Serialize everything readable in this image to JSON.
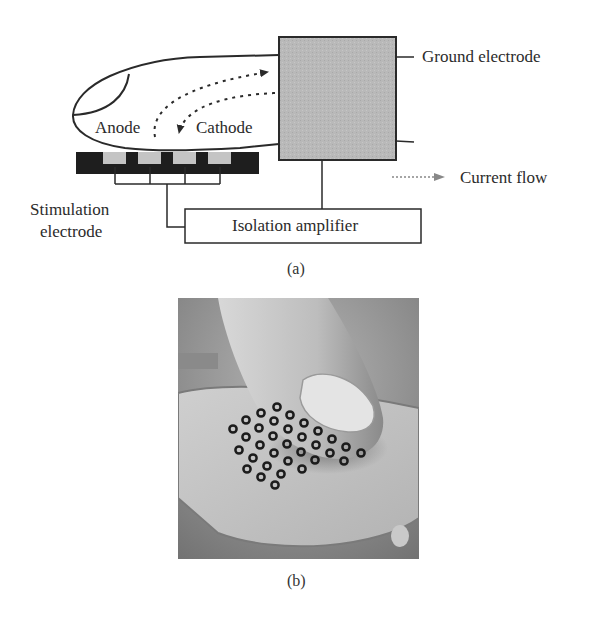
{
  "figure": {
    "panel_a": {
      "caption": "(a)",
      "labels": {
        "anode": "Anode",
        "cathode": "Cathode",
        "ground_electrode": "Ground electrode",
        "current_flow": "Current flow",
        "stimulation_electrode_line1": "Stimulation",
        "stimulation_electrode_line2": "electrode",
        "isolation_amplifier": "Isolation amplifier"
      },
      "colors": {
        "ground_box_fill": "#b8b8b8",
        "electrode_bar": "#1e1e1e",
        "electrode_pad": "#c4c4c4",
        "legend_arrow": "#888888",
        "stroke": "#2a2a2a"
      },
      "electrode_pad_count": 4
    },
    "panel_b": {
      "caption": "(b)",
      "description": "Photograph of a fingertip pressing on an electrotactile electrode array",
      "array_rows": 6,
      "array_cols": 6
    }
  }
}
